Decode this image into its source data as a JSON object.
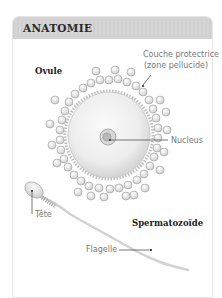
{
  "header": {
    "title": "ANATOMIE"
  },
  "labels": {
    "ovule": "Ovule",
    "couche_line1": "Couche protectrice",
    "couche_line2": "(zone pellucide)",
    "nucleus": "Nucleus",
    "tete": "Tête",
    "spermatozoide": "Spermatozoïde",
    "flagelle": "Flagelle"
  },
  "colors": {
    "header_bg": "#d3d3d3",
    "card_border": "#e6e6e6",
    "egg_fill": "#ececec",
    "leader_line": "#444444"
  }
}
